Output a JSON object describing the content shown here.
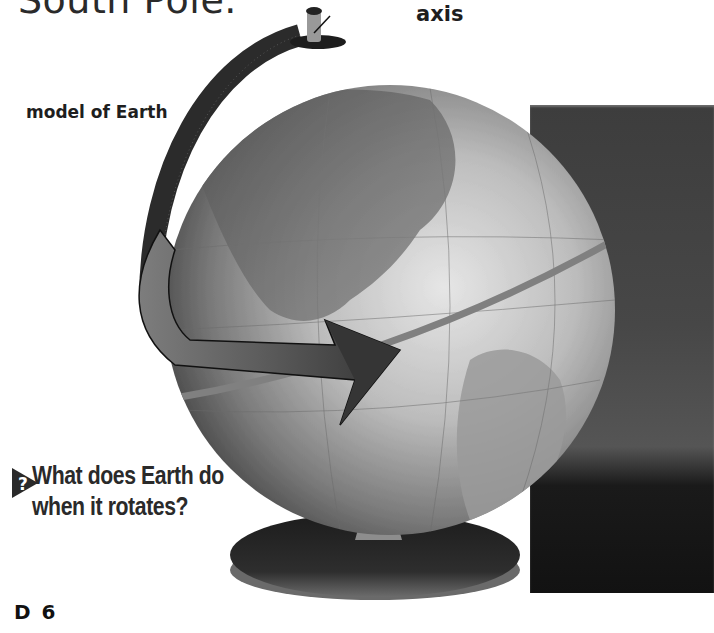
{
  "page": {
    "top_text": "South Pole.",
    "page_number": "D 6"
  },
  "figure": {
    "labels": {
      "axis": "axis",
      "model": "model of Earth"
    },
    "globe_map_labels": [
      "AMERICA",
      "ATLANTIC",
      "GULF OF MEXICO",
      "CENTRAL AMERICA",
      "SOUTH AMERICA",
      "ECUADOR",
      "PERU",
      "VENEZUELA",
      "COLOMBIA"
    ],
    "rotation_arrow_direction": "west-to-east"
  },
  "question": {
    "icon": "question-arrow-icon",
    "line1": "What does Earth do",
    "line2": "when it rotates?"
  },
  "colors": {
    "text": "#222222",
    "backdrop": "#444444",
    "arrow": "#3a3a3a",
    "globe": "#bdbdbd"
  }
}
